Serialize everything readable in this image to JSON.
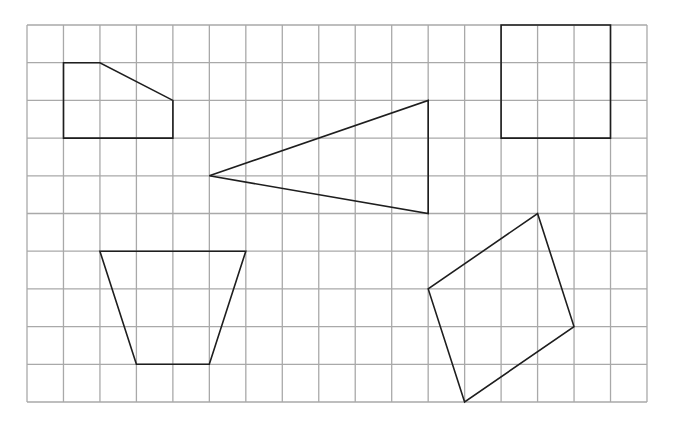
{
  "colors": {
    "background": "#ffffff",
    "grid_line": "#a9a9a9",
    "shape_line": "#1e1e1e"
  },
  "grid": {
    "origin_x": 27,
    "origin_y": 25,
    "cols": 17,
    "rows": 10,
    "cell_w": 36.47,
    "cell_h": 37.7
  },
  "shapes": [
    {
      "name": "pentagon-shape",
      "label": "Pentagon",
      "points": [
        [
          1,
          1
        ],
        [
          2,
          1
        ],
        [
          4,
          2
        ],
        [
          4,
          3
        ],
        [
          1,
          3
        ]
      ]
    },
    {
      "name": "triangle-shape",
      "label": "Triangle",
      "points": [
        [
          5,
          4
        ],
        [
          11,
          2
        ],
        [
          11,
          5
        ]
      ]
    },
    {
      "name": "square-shape",
      "label": "Square",
      "points": [
        [
          13,
          0
        ],
        [
          16,
          0
        ],
        [
          16,
          3
        ],
        [
          13,
          3
        ]
      ]
    },
    {
      "name": "trapezoid-shape",
      "label": "Trapezoid",
      "points": [
        [
          2,
          6
        ],
        [
          6,
          6
        ],
        [
          5,
          9
        ],
        [
          3,
          9
        ]
      ]
    },
    {
      "name": "rotated-square-shape",
      "label": "Rotated quadrilateral",
      "points": [
        [
          14,
          5
        ],
        [
          15,
          8
        ],
        [
          12,
          10
        ],
        [
          11,
          7
        ]
      ]
    }
  ]
}
